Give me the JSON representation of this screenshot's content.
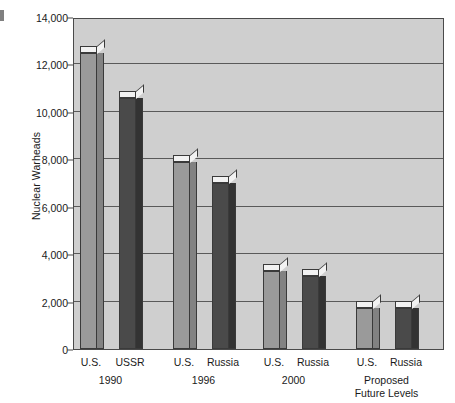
{
  "chart_data": {
    "type": "bar",
    "title": "",
    "subtitle": "",
    "xlabel": "",
    "ylabel": "Nuclear Warheads",
    "ylim": [
      0,
      14000
    ],
    "y_tick_labels": [
      "0",
      "2,000",
      "4,000",
      "6,000",
      "8,000",
      "10,000",
      "12,000",
      "14,000"
    ],
    "y_tick_values": [
      0,
      2000,
      4000,
      6000,
      8000,
      10000,
      12000,
      14000
    ],
    "y_tick_interval": 2000,
    "grid": true,
    "legend": "none",
    "style": "3d-grouped-bar",
    "categories": [
      "1990",
      "1996",
      "2000",
      "Proposed Future Levels"
    ],
    "groups": [
      {
        "group_label": "1990",
        "group_label_lines": [
          "1990"
        ],
        "bars": [
          {
            "label": "U.S.",
            "value": 12500,
            "series": "series-a"
          },
          {
            "label": "USSR",
            "value": 10600,
            "series": "series-b"
          }
        ]
      },
      {
        "group_label": "1996",
        "group_label_lines": [
          "1996"
        ],
        "bars": [
          {
            "label": "U.S.",
            "value": 7900,
            "series": "series-a"
          },
          {
            "label": "Russia",
            "value": 7000,
            "series": "series-b"
          }
        ]
      },
      {
        "group_label": "2000",
        "group_label_lines": [
          "2000"
        ],
        "bars": [
          {
            "label": "U.S.",
            "value": 3300,
            "series": "series-a"
          },
          {
            "label": "Russia",
            "value": 3100,
            "series": "series-b"
          }
        ]
      },
      {
        "group_label": "Proposed Future Levels",
        "group_label_lines": [
          "Proposed",
          "Future Levels"
        ],
        "bars": [
          {
            "label": "U.S.",
            "value": 1750,
            "series": "series-a"
          },
          {
            "label": "Russia",
            "value": 1750,
            "series": "series-b"
          }
        ]
      }
    ],
    "series": [
      {
        "name": "U.S.",
        "color": "#9a9a9a",
        "values": [
          12500,
          7900,
          3300,
          1750
        ]
      },
      {
        "name": "USSR / Russia",
        "color": "#4a4a4a",
        "values": [
          10600,
          7000,
          3100,
          1750
        ]
      }
    ]
  },
  "colors": {
    "plot_background": "#cfcfcf",
    "page_background": "#ffffff",
    "gridline": "#5a5a5a",
    "axis": "#4a4a4a",
    "series_a": "#9a9a9a",
    "series_a_side": "#828282",
    "series_b": "#4a4a4a",
    "series_b_side": "#333333",
    "bar_top": "#f2f2f2",
    "text": "#1a1a1a"
  }
}
